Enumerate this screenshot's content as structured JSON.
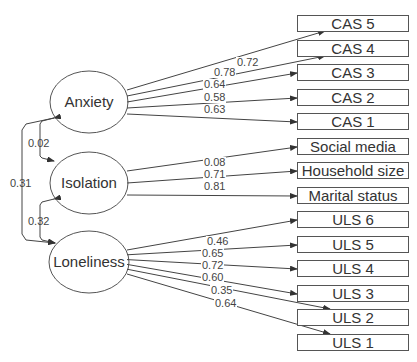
{
  "diagram": {
    "type": "structural-equation-model",
    "latents": [
      {
        "id": "anxiety",
        "label": "Anxiety",
        "cx": 89,
        "cy": 102
      },
      {
        "id": "isolation",
        "label": "Isolation",
        "cx": 89,
        "cy": 183
      },
      {
        "id": "loneliness",
        "label": "Loneliness",
        "cx": 89,
        "cy": 262
      }
    ],
    "indicators": [
      {
        "label": "CAS 5",
        "y": 15
      },
      {
        "label": "CAS 4",
        "y": 40
      },
      {
        "label": "CAS 3",
        "y": 64
      },
      {
        "label": "CAS 2",
        "y": 89
      },
      {
        "label": "CAS 1",
        "y": 113
      },
      {
        "label": "Social media",
        "y": 138
      },
      {
        "label": "Household size",
        "y": 162
      },
      {
        "label": "Marital status",
        "y": 187
      },
      {
        "label": "ULS 6",
        "y": 211
      },
      {
        "label": "ULS 5",
        "y": 236
      },
      {
        "label": "ULS 4",
        "y": 260
      },
      {
        "label": "ULS 3",
        "y": 285
      },
      {
        "label": "ULS 2",
        "y": 309
      },
      {
        "label": "ULS 1",
        "y": 334
      }
    ],
    "loadings": [
      {
        "from": "Anxiety",
        "to": "CAS 5",
        "value": "0.72",
        "lx": 236,
        "ly": 62
      },
      {
        "from": "Anxiety",
        "to": "CAS 4",
        "value": "0.78",
        "lx": 213,
        "ly": 71
      },
      {
        "from": "Anxiety",
        "to": "CAS 3",
        "value": "0.64",
        "lx": 203,
        "ly": 83
      },
      {
        "from": "Anxiety",
        "to": "CAS 2",
        "value": "0.58",
        "lx": 203,
        "ly": 95
      },
      {
        "from": "Anxiety",
        "to": "CAS 1",
        "value": "0.63",
        "lx": 203,
        "ly": 107
      },
      {
        "from": "Isolation",
        "to": "Social media",
        "value": "0.08",
        "lx": 203,
        "ly": 158
      },
      {
        "from": "Isolation",
        "to": "Household size",
        "value": "0.71",
        "lx": 203,
        "ly": 170
      },
      {
        "from": "Isolation",
        "to": "Marital status",
        "value": "0.81",
        "lx": 203,
        "ly": 182
      },
      {
        "from": "Loneliness",
        "to": "ULS 6",
        "value": "0.46",
        "lx": 206,
        "ly": 236
      },
      {
        "from": "Loneliness",
        "to": "ULS 5",
        "value": "0.65",
        "lx": 201,
        "ly": 248
      },
      {
        "from": "Loneliness",
        "to": "ULS 4",
        "value": "0.72",
        "lx": 201,
        "ly": 260
      },
      {
        "from": "Loneliness",
        "to": "ULS 3",
        "value": "0.60",
        "lx": 201,
        "ly": 272
      },
      {
        "from": "Loneliness",
        "to": "ULS 2",
        "value": "0.35",
        "lx": 210,
        "ly": 285
      },
      {
        "from": "Loneliness",
        "to": "ULS 1",
        "value": "0.64",
        "lx": 214,
        "ly": 298
      }
    ],
    "correlations": [
      {
        "between": [
          "Anxiety",
          "Isolation"
        ],
        "value": "0.02"
      },
      {
        "between": [
          "Anxiety",
          "Loneliness"
        ],
        "value": "0.31"
      },
      {
        "between": [
          "Isolation",
          "Loneliness"
        ],
        "value": "0.32"
      }
    ]
  }
}
